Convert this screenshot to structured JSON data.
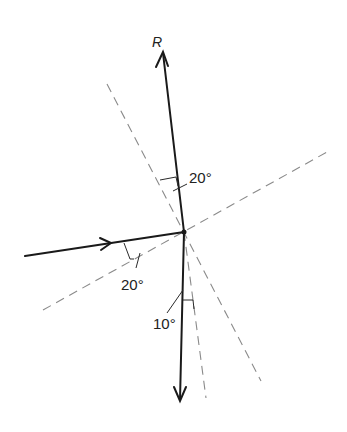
{
  "diagram": {
    "force_label": "R",
    "angles": [
      {
        "id": "upper",
        "label": "20°"
      },
      {
        "id": "incoming",
        "label": "20°"
      },
      {
        "id": "lower",
        "label": "10°"
      }
    ],
    "colors": {
      "solid_line": "#1a1a1a",
      "dashed_line": "#8a8a8a",
      "background": "#ffffff"
    }
  }
}
